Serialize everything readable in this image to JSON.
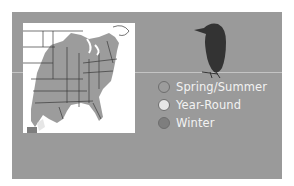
{
  "panel": {
    "background": "#9a9a9a",
    "separator_color": "#c4c4c4"
  },
  "map": {
    "region": "Eastern United States",
    "background": "#ffffff",
    "range_color": "#9c9c9c",
    "border_color": "#3a3a3a"
  },
  "bird": {
    "icon": "bird-silhouette-icon",
    "color": "#333333"
  },
  "legend": {
    "items": [
      {
        "label": "Spring/Summer",
        "color": "#9c9c9c"
      },
      {
        "label": "Year-Round",
        "color": "#e6e6e6"
      },
      {
        "label": "Winter",
        "color": "#7e7e7e"
      }
    ]
  }
}
